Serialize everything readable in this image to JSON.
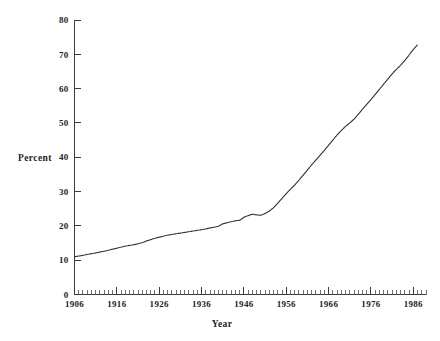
{
  "chart_data": {
    "type": "line",
    "title": "",
    "subtitle": "",
    "xlabel": "Year",
    "ylabel": "Percent",
    "xlim": [
      1906,
      1989
    ],
    "ylim": [
      0,
      80
    ],
    "grid": false,
    "legend": "none",
    "y_ticks": [
      0,
      10,
      20,
      30,
      40,
      50,
      60,
      70,
      80
    ],
    "y_tick_labels": [
      "0",
      "10",
      "20",
      "30",
      "40",
      "50",
      "60",
      "70",
      "80"
    ],
    "x_ticks": [
      1906,
      1916,
      1926,
      1936,
      1946,
      1956,
      1966,
      1976,
      1986
    ],
    "x_tick_labels": [
      "1906",
      "1916",
      "1926",
      "1936",
      "1946",
      "1956",
      "1966",
      "1976",
      "1986"
    ],
    "x_minor_tick_interval": 1,
    "series": [
      {
        "name": "Percent",
        "style": "dotted-line",
        "color": "#2b2b2b",
        "x": [
          1906,
          1907,
          1908,
          1909,
          1910,
          1911,
          1912,
          1913,
          1914,
          1915,
          1916,
          1917,
          1918,
          1919,
          1920,
          1921,
          1922,
          1923,
          1924,
          1925,
          1926,
          1927,
          1928,
          1929,
          1930,
          1931,
          1932,
          1933,
          1934,
          1935,
          1936,
          1937,
          1938,
          1939,
          1940,
          1941,
          1942,
          1943,
          1944,
          1945,
          1946,
          1947,
          1948,
          1949,
          1950,
          1951,
          1952,
          1953,
          1954,
          1955,
          1956,
          1957,
          1958,
          1959,
          1960,
          1961,
          1962,
          1963,
          1964,
          1965,
          1966,
          1967,
          1968,
          1969,
          1970,
          1971,
          1972,
          1973,
          1974,
          1975,
          1976,
          1977,
          1978,
          1979,
          1980,
          1981,
          1982,
          1983,
          1984,
          1985,
          1986,
          1987
        ],
        "y": [
          11.0,
          11.2,
          11.4,
          11.7,
          11.9,
          12.1,
          12.4,
          12.6,
          12.9,
          13.2,
          13.5,
          13.8,
          14.1,
          14.3,
          14.5,
          14.8,
          15.1,
          15.6,
          16.0,
          16.4,
          16.7,
          17.0,
          17.3,
          17.5,
          17.7,
          17.9,
          18.1,
          18.3,
          18.5,
          18.7,
          18.9,
          19.1,
          19.4,
          19.6,
          19.9,
          20.6,
          20.9,
          21.2,
          21.5,
          21.6,
          22.5,
          23.0,
          23.4,
          23.2,
          23.1,
          23.6,
          24.3,
          25.3,
          26.6,
          28.0,
          29.4,
          30.7,
          31.9,
          33.3,
          34.8,
          36.3,
          37.8,
          39.2,
          40.6,
          42.0,
          43.5,
          45.0,
          46.5,
          47.8,
          49.0,
          50.0,
          51.1,
          52.5,
          54.0,
          55.4,
          56.8,
          58.3,
          59.8,
          61.3,
          62.8,
          64.3,
          65.6,
          66.8,
          68.2,
          69.8,
          71.4,
          72.8
        ]
      }
    ]
  },
  "axis": {
    "y_title": "Percent",
    "x_title": "Year"
  }
}
